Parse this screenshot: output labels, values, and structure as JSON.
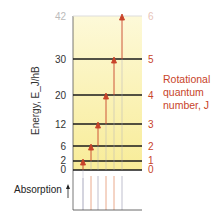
{
  "diagram": {
    "axis_title": "Energy, E_J/hB",
    "axis_title_parts": {
      "main": "Energy, ",
      "E": "E",
      "sub": "J",
      "rest": "/hB"
    },
    "right_title_lines": [
      "Rotational",
      "quantum",
      "number, J"
    ],
    "absorption_label": "Absorption",
    "levels": [
      {
        "J": "0",
        "energy": "0"
      },
      {
        "J": "1",
        "energy": "2"
      },
      {
        "J": "2",
        "energy": "6"
      },
      {
        "J": "3",
        "energy": "12"
      },
      {
        "J": "4",
        "energy": "20"
      },
      {
        "J": "5",
        "energy": "30"
      },
      {
        "J": "6",
        "energy": "42"
      }
    ],
    "transitions": [
      "0→1",
      "1→2",
      "2→3",
      "3→4",
      "4→5",
      "5→6"
    ],
    "colors": {
      "panel_fill": "#fbf3b0",
      "level_line": "#1a1a1a",
      "arrow": "#c8442a",
      "label_accent": "#c8442a"
    }
  }
}
